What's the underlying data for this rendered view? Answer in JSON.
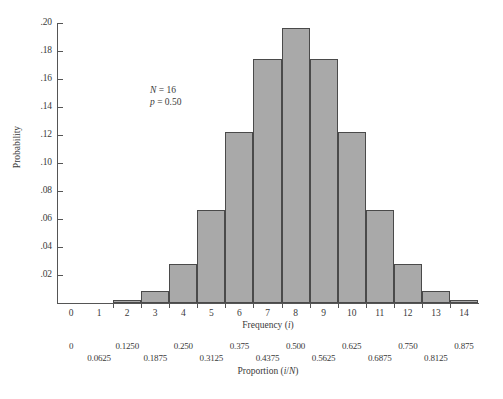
{
  "chart_data": {
    "type": "bar",
    "title": "",
    "subtitle": "",
    "xlabel": "Frequency (i)",
    "ylabel": "Probability",
    "secondary_xlabel": "Proportion (i/N)",
    "grid": false,
    "legend": "none",
    "xlim": [
      -0.5,
      14.5
    ],
    "ylim": [
      0,
      0.2
    ],
    "categories": [
      "0",
      "1",
      "2",
      "3",
      "4",
      "5",
      "6",
      "7",
      "8",
      "9",
      "10",
      "11",
      "12",
      "13",
      "14"
    ],
    "values": [
      0,
      0,
      0.0018,
      0.0085,
      0.0278,
      0.0667,
      0.1222,
      0.1746,
      0.1964,
      0.1746,
      0.1222,
      0.0667,
      0.0278,
      0.0085,
      0.0018
    ],
    "series": [
      {
        "name": "Binomial probability",
        "values": [
          0,
          0,
          0.0018,
          0.0085,
          0.0278,
          0.0667,
          0.1222,
          0.1746,
          0.1964,
          0.1746,
          0.1222,
          0.0667,
          0.0278,
          0.0085,
          0.0018
        ]
      }
    ],
    "ytick_labels": [
      ".20",
      ".18",
      ".16",
      ".14",
      ".12",
      ".10",
      ".08",
      ".06",
      ".04",
      ".02"
    ],
    "ytick_values": [
      0.2,
      0.18,
      0.16,
      0.14,
      0.12,
      0.1,
      0.08,
      0.06,
      0.04,
      0.02
    ],
    "xtick_labels": [
      "0",
      "1",
      "2",
      "3",
      "4",
      "5",
      "6",
      "7",
      "8",
      "9",
      "10",
      "11",
      "12",
      "13",
      "14"
    ],
    "xtick_values": [
      0,
      1,
      2,
      3,
      4,
      5,
      6,
      7,
      8,
      9,
      10,
      11,
      12,
      13,
      14
    ],
    "proportion_axis": {
      "top_row": [
        {
          "x": 0,
          "label": "0"
        },
        {
          "x": 2,
          "label": "0.1250"
        },
        {
          "x": 4,
          "label": "0.250"
        },
        {
          "x": 6,
          "label": "0.375"
        },
        {
          "x": 8,
          "label": "0.500"
        },
        {
          "x": 10,
          "label": "0.625"
        },
        {
          "x": 12,
          "label": "0.750"
        },
        {
          "x": 14,
          "label": "0.875"
        }
      ],
      "bottom_row": [
        {
          "x": 1,
          "label": "0.0625"
        },
        {
          "x": 3,
          "label": "0.1875"
        },
        {
          "x": 5,
          "label": "0.3125"
        },
        {
          "x": 7,
          "label": "0.4375"
        },
        {
          "x": 9,
          "label": "0.5625"
        },
        {
          "x": 11,
          "label": "0.6875"
        },
        {
          "x": 13,
          "label": "0.8125"
        }
      ]
    },
    "annotations": [
      {
        "text": "N = 16",
        "italic_prefix": "N",
        "rest": " = 16"
      },
      {
        "text": "p = 0.50",
        "italic_prefix": "p",
        "rest": " = 0.50"
      }
    ],
    "colors": {
      "bar_fill": "#a9a9a9",
      "bar_stroke": "#4a4a4a",
      "axis": "#555555",
      "text": "#3a3a3a",
      "background": "#ffffff"
    }
  }
}
